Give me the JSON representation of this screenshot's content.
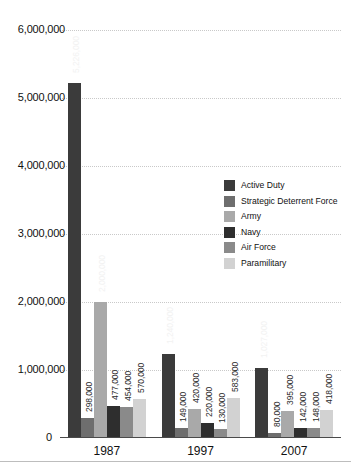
{
  "chart_data": {
    "type": "bar",
    "title": "",
    "xlabel": "",
    "ylabel": "",
    "ylim": [
      0,
      6000000
    ],
    "grid": true,
    "legend_position": "inside-right",
    "categories": [
      "1987",
      "1997",
      "2007"
    ],
    "ytick_labels": [
      "6,000,000",
      "5,000,000",
      "4,000,000",
      "3,000,000",
      "2,000,000",
      "1,000,000",
      "0"
    ],
    "ytick_values": [
      6000000,
      5000000,
      4000000,
      3000000,
      2000000,
      1000000,
      0
    ],
    "series": [
      {
        "name": "Active Duty",
        "color": "#3b3b3b",
        "values": [
          5226000,
          1240000,
          1027000
        ],
        "labels": [
          "5,226,000",
          "1,240,000",
          "1,027,000"
        ]
      },
      {
        "name": "Strategic Deterrent Force",
        "color": "#6e6e6e",
        "values": [
          298000,
          149000,
          80000
        ],
        "labels": [
          "298,000",
          "149,000",
          "80,000"
        ]
      },
      {
        "name": "Army",
        "color": "#a9a9a9",
        "values": [
          2000000,
          420000,
          395000
        ],
        "labels": [
          "2,000,000",
          "420,000",
          "395,000"
        ]
      },
      {
        "name": "Navy",
        "color": "#2e2e2e",
        "values": [
          477000,
          220000,
          142000
        ],
        "labels": [
          "477,000",
          "220,000",
          "142,000"
        ]
      },
      {
        "name": "Air Force",
        "color": "#8a8a8a",
        "values": [
          454000,
          130000,
          148000
        ],
        "labels": [
          "454,000",
          "130,000",
          "148,000"
        ]
      },
      {
        "name": "Paramilitary",
        "color": "#d2d2d2",
        "values": [
          570000,
          583000,
          418000
        ],
        "labels": [
          "570,000",
          "583,000",
          "418,000"
        ]
      }
    ]
  },
  "axis": {
    "zero_label": "0"
  }
}
